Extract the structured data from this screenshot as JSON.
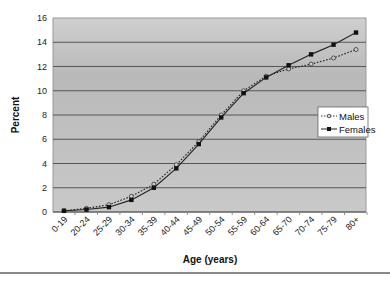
{
  "chart_data": {
    "type": "line",
    "title": "",
    "xlabel": "Age (years)",
    "ylabel": "Percent",
    "ylim": [
      0,
      16
    ],
    "yticks": [
      0,
      2,
      4,
      6,
      8,
      10,
      12,
      14,
      16
    ],
    "grid": true,
    "legend_position": "right-inside",
    "categories": [
      "0-19",
      "20-24",
      "25-29",
      "30-34",
      "35-39",
      "40-44",
      "45-49",
      "50-54",
      "55-59",
      "60-64",
      "65-70",
      "70-74",
      "75-79",
      "80+"
    ],
    "series": [
      {
        "name": "Males",
        "style": "dotted",
        "marker": "circle-open",
        "values": [
          0.1,
          0.3,
          0.6,
          1.3,
          2.3,
          3.9,
          5.8,
          8.0,
          10.0,
          11.2,
          11.8,
          12.2,
          12.7,
          13.4
        ]
      },
      {
        "name": "Females",
        "style": "solid",
        "marker": "square-filled",
        "values": [
          0.1,
          0.2,
          0.4,
          1.0,
          2.0,
          3.6,
          5.6,
          7.8,
          9.8,
          11.1,
          12.1,
          13.0,
          13.8,
          14.8
        ]
      }
    ]
  },
  "colors": {
    "plot_background": "#c4c4c4",
    "gridline": "#555555",
    "series_line": "#222222",
    "legend_background": "#ffffff"
  }
}
